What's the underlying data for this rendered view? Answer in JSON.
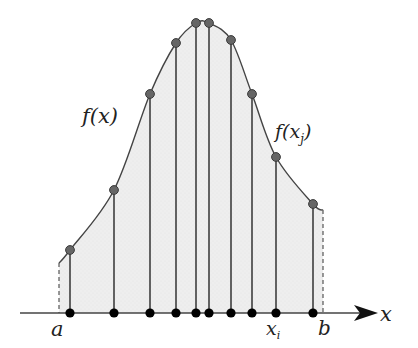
{
  "diagram": {
    "colors": {
      "fill": "#ececec",
      "curve": "#444444",
      "stem": "#333333",
      "sample_point": "#666666",
      "axis_point": "#000000",
      "axis": "#444444",
      "dashed": "#555555"
    },
    "axis": {
      "y": 313,
      "x_start": 20,
      "x_end": 378
    },
    "labels": {
      "function": "f(x)",
      "function_sample_prefix": "f(x",
      "function_sample_sub": "j",
      "function_sample_suffix": ")",
      "lower_bound": "a",
      "upper_bound": "b",
      "axis": "x",
      "sample_x": "x",
      "sample_x_sub": "i"
    },
    "bounds": {
      "a": {
        "x": 59,
        "fy": 263
      },
      "b": {
        "x": 323,
        "fy": 210
      }
    },
    "samples": [
      {
        "x": 70,
        "fy": 250
      },
      {
        "x": 114,
        "fy": 190
      },
      {
        "x": 150,
        "fy": 94
      },
      {
        "x": 176,
        "fy": 43
      },
      {
        "x": 196,
        "fy": 23
      },
      {
        "x": 209,
        "fy": 23
      },
      {
        "x": 231,
        "fy": 40
      },
      {
        "x": 252,
        "fy": 94
      },
      {
        "x": 276,
        "fy": 157
      },
      {
        "x": 313,
        "fy": 204
      }
    ]
  }
}
